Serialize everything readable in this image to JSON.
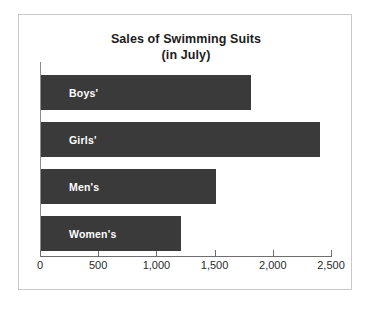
{
  "chart_data": {
    "type": "bar",
    "orientation": "horizontal",
    "title": "Sales of Swimming Suits",
    "subtitle": "(in July)",
    "xlabel": "",
    "ylabel": "",
    "categories": [
      "Boys'",
      "Girls'",
      "Men's",
      "Women's"
    ],
    "values": [
      1800,
      2400,
      1500,
      1200
    ],
    "xlim": [
      0,
      2500
    ],
    "xticks": [
      0,
      500,
      1000,
      1500,
      2000,
      2500
    ],
    "xtick_labels": [
      "0",
      "500",
      "1,000",
      "1,500",
      "2,000",
      "2,500"
    ],
    "grid": false,
    "legend": false,
    "bar_color": "#3a3a3a",
    "bar_label_color": "#ffffff",
    "axis_color": "#6e6e6e",
    "background_color": "#ffffff",
    "border_color": "#c9c9c9",
    "bars": [
      {
        "label": "Boys'",
        "value": 1800
      },
      {
        "label": "Girls'",
        "value": 2400
      },
      {
        "label": "Men's",
        "value": 1500
      },
      {
        "label": "Women's",
        "value": 1200
      }
    ]
  }
}
